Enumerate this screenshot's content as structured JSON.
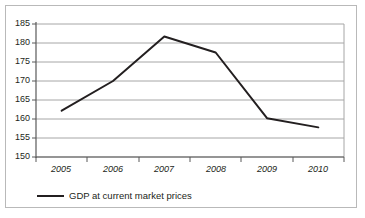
{
  "chart_data": {
    "type": "line",
    "title": "",
    "subtitle": "",
    "xlabel": "",
    "ylabel": "",
    "categories": [
      "2005",
      "2006",
      "2007",
      "2008",
      "2009",
      "2010"
    ],
    "x": [
      2005,
      2006,
      2007,
      2008,
      2009,
      2010
    ],
    "series": [
      {
        "name": "GDP at current market prices",
        "values": [
          162.2,
          170.0,
          181.7,
          177.5,
          160.2,
          157.8
        ],
        "color": "#231f20"
      }
    ],
    "ylim": [
      150,
      185
    ],
    "yticks": [
      150,
      155,
      160,
      165,
      170,
      175,
      180,
      185
    ],
    "ytick_labels": [
      "150",
      "155",
      "160",
      "165",
      "170",
      "175",
      "180",
      "185"
    ],
    "xtick_labels": [
      "2005",
      "2006",
      "2007",
      "2008",
      "2009",
      "2010"
    ],
    "grid": true,
    "grid_axis": "y",
    "grid_color": "#a6a6a6",
    "legend": {
      "position": "bottom-left",
      "entries": [
        {
          "label": "GDP at current market prices",
          "marker": "line",
          "color": "#231f20"
        }
      ]
    },
    "axis_color": "#595959",
    "border_color": "#b9b9b9",
    "background": "#ffffff"
  }
}
